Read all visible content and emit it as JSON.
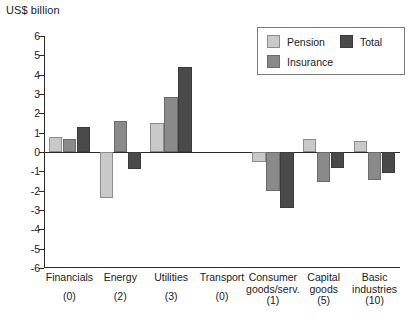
{
  "chart_data": {
    "type": "bar",
    "title": "",
    "ylabel": "US$ billion",
    "xlabel": "",
    "ylim": [
      -6,
      6
    ],
    "yticks": [
      6,
      5,
      4,
      3,
      2,
      1,
      0,
      -1,
      -2,
      -3,
      -4,
      -5,
      -6
    ],
    "ytick_labels": [
      "6",
      "5",
      "4",
      "3",
      "2",
      "1",
      "0",
      "-1",
      "-2",
      "-3",
      "-4",
      "-5",
      "-6"
    ],
    "grid": false,
    "legend_position": "top-right",
    "categories": [
      "Financials",
      "Energy",
      "Utilities",
      "Transport",
      "Consumer goods/serv.",
      "Capital goods",
      "Basic industries"
    ],
    "category_lines": [
      [
        "Financials"
      ],
      [
        "Energy"
      ],
      [
        "Utilities"
      ],
      [
        "Transport"
      ],
      [
        "Consumer",
        "goods/serv."
      ],
      [
        "Capital",
        "goods"
      ],
      [
        "Basic",
        "industries"
      ]
    ],
    "category_counts": [
      "(0)",
      "(2)",
      "(3)",
      "(0)",
      "(1)",
      "(5)",
      "(10)"
    ],
    "series": [
      {
        "name": "Pension",
        "color": "#c9c9c9",
        "values": [
          0.8,
          -2.4,
          1.5,
          0,
          -0.5,
          0.65,
          0.55
        ]
      },
      {
        "name": "Insurance",
        "color": "#8a8a8a",
        "values": [
          0.65,
          1.6,
          2.85,
          0,
          -2.0,
          -1.55,
          -1.45
        ]
      },
      {
        "name": "Total",
        "color": "#4a4a4a",
        "values": [
          1.3,
          -0.9,
          4.4,
          0,
          -2.9,
          -0.85,
          -1.1
        ]
      }
    ]
  },
  "legend": {
    "items": [
      {
        "label": "Pension",
        "swatch": "pension"
      },
      {
        "label": "Total",
        "swatch": "total"
      },
      {
        "label": "Insurance",
        "swatch": "insurance"
      }
    ]
  },
  "caption": {
    "text": ""
  }
}
